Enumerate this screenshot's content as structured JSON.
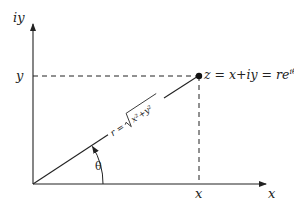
{
  "diagram": {
    "type": "complex-plane-polar-form",
    "axes": {
      "y_axis_label": "iy",
      "x_axis_label": "x"
    },
    "ticks": {
      "y_tick_label": "y",
      "x_tick_label": "x"
    },
    "point": {
      "label_lhs": "z = x+iy = re",
      "label_exp": "iθ"
    },
    "radius": {
      "label_prefix": "r =",
      "label_radicand": "x²+y²"
    },
    "angle": {
      "label": "θ"
    },
    "colors": {
      "stroke": "#222222",
      "background": "#ffffff"
    }
  }
}
